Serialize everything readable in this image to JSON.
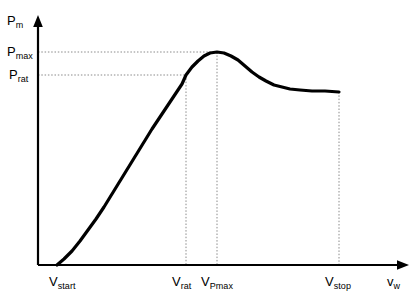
{
  "chart_data": {
    "type": "line",
    "title": "",
    "xlabel": "v_w",
    "ylabel": "P_m",
    "grid": false,
    "legend": null,
    "axes": {
      "y_axis_label_main": "P",
      "y_axis_label_sub": "m",
      "x_axis_label_main": "v",
      "x_axis_label_sub": "w",
      "x_origin_px": 38,
      "y_origin_px": 265,
      "x_range_px": [
        38,
        408
      ],
      "y_range_px": [
        265,
        18
      ]
    },
    "y_ticks": [
      {
        "main": "P",
        "sub": "max",
        "value_px": 52,
        "dashed_guide": true
      },
      {
        "main": "P",
        "sub": "rat",
        "value_px": 75,
        "dashed_guide": true
      }
    ],
    "x_ticks": [
      {
        "main": "V",
        "sub": "start",
        "value_px": 57,
        "dashed_guide": false
      },
      {
        "main": "V",
        "sub": "rat",
        "value_px": 186,
        "dashed_guide": true
      },
      {
        "main": "V",
        "sub": "Pmax",
        "value_px": 217,
        "dashed_guide": true
      },
      {
        "main": "V",
        "sub": "stop",
        "value_px": 339,
        "dashed_guide": true
      }
    ],
    "series": [
      {
        "name": "mechanical power curve",
        "points_px": [
          [
            57,
            265
          ],
          [
            64,
            259
          ],
          [
            72,
            251
          ],
          [
            80,
            241
          ],
          [
            88,
            230
          ],
          [
            96,
            219
          ],
          [
            104,
            207
          ],
          [
            112,
            194
          ],
          [
            120,
            181
          ],
          [
            128,
            168
          ],
          [
            136,
            155
          ],
          [
            144,
            142
          ],
          [
            152,
            129
          ],
          [
            160,
            117
          ],
          [
            168,
            105
          ],
          [
            176,
            93
          ],
          [
            182,
            84
          ],
          [
            186,
            75
          ],
          [
            192,
            67
          ],
          [
            198,
            61
          ],
          [
            204,
            56
          ],
          [
            210,
            53
          ],
          [
            217,
            52
          ],
          [
            224,
            53
          ],
          [
            231,
            56
          ],
          [
            238,
            60
          ],
          [
            245,
            66
          ],
          [
            252,
            72
          ],
          [
            259,
            77
          ],
          [
            266,
            81
          ],
          [
            274,
            85
          ],
          [
            282,
            87
          ],
          [
            290,
            89
          ],
          [
            300,
            90
          ],
          [
            312,
            91
          ],
          [
            325,
            91
          ],
          [
            339,
            92
          ]
        ]
      }
    ],
    "annotations": [
      {
        "type": "hline",
        "from_px": [
          38,
          52
        ],
        "to_px": [
          217,
          52
        ],
        "style": "dotted"
      },
      {
        "type": "hline",
        "from_px": [
          38,
          75
        ],
        "to_px": [
          186,
          75
        ],
        "style": "dotted"
      },
      {
        "type": "vline",
        "from_px": [
          186,
          75
        ],
        "to_px": [
          186,
          265
        ],
        "style": "dotted"
      },
      {
        "type": "vline",
        "from_px": [
          217,
          52
        ],
        "to_px": [
          217,
          265
        ],
        "style": "dotted"
      },
      {
        "type": "vline",
        "from_px": [
          339,
          92
        ],
        "to_px": [
          339,
          265
        ],
        "style": "dotted"
      }
    ],
    "colors": {
      "curve": "#000000",
      "axis": "#000000",
      "guide": "#8a8a8a",
      "background": "#ffffff",
      "text": "#000000"
    }
  }
}
